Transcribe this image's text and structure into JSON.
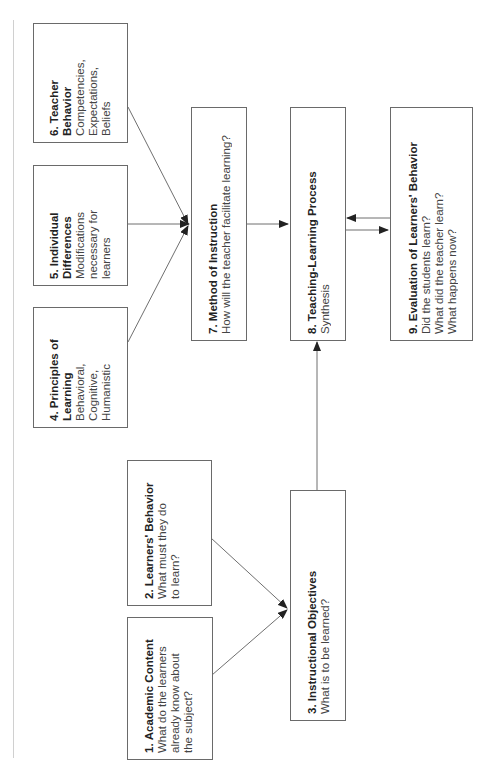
{
  "diagram": {
    "orientation": "rotated-90-ccw",
    "colors": {
      "box_border": "#6a6a6a",
      "line": "#4a4a4a",
      "text": "#2a2a2a",
      "background": "#ffffff"
    },
    "nodes": [
      {
        "id": 1,
        "number": "1.",
        "title": "Academic Content",
        "description": [
          "What do the learners",
          "already know about",
          "the subject?"
        ]
      },
      {
        "id": 2,
        "number": "2.",
        "title": "Learners' Behavior",
        "description": [
          "What must they do",
          "to learn?"
        ]
      },
      {
        "id": 3,
        "number": "3.",
        "title": "Instructional Objectives",
        "description": [
          "What is to be learned?"
        ]
      },
      {
        "id": 4,
        "number": "4.",
        "title": "Principles of",
        "title2": "Learning",
        "description": [
          "Behavioral,",
          "Cognitive,",
          "Humanistic"
        ]
      },
      {
        "id": 5,
        "number": "5.",
        "title": "Individual",
        "title2": "Differences",
        "description": [
          "Modifications",
          "necessary for",
          "learners"
        ]
      },
      {
        "id": 6,
        "number": "6.",
        "title": "Teacher",
        "title2": "Behavior",
        "description": [
          "Competencies,",
          "Expectations,",
          "Beliefs"
        ]
      },
      {
        "id": 7,
        "number": "7.",
        "title": "Method of Instruction",
        "description": [
          "How will the teacher facilitate learning?"
        ]
      },
      {
        "id": 8,
        "number": "8.",
        "title": "Teaching-Learning Process",
        "description": [
          "Synthesis"
        ]
      },
      {
        "id": 9,
        "number": "9.",
        "title": "Evaluation of Learners' Behavior",
        "description": [
          "Did the students learn?",
          "What did the teacher learn?",
          "What happens now?"
        ]
      }
    ],
    "edges": [
      {
        "from": 1,
        "to": 3
      },
      {
        "from": 2,
        "to": 3
      },
      {
        "from": 3,
        "to": 8
      },
      {
        "from": 4,
        "to": 7
      },
      {
        "from": 5,
        "to": 7
      },
      {
        "from": 6,
        "to": 7
      },
      {
        "from": 7,
        "to": 8
      },
      {
        "from": 8,
        "to": 9
      },
      {
        "from": 9,
        "to": 8
      }
    ]
  }
}
